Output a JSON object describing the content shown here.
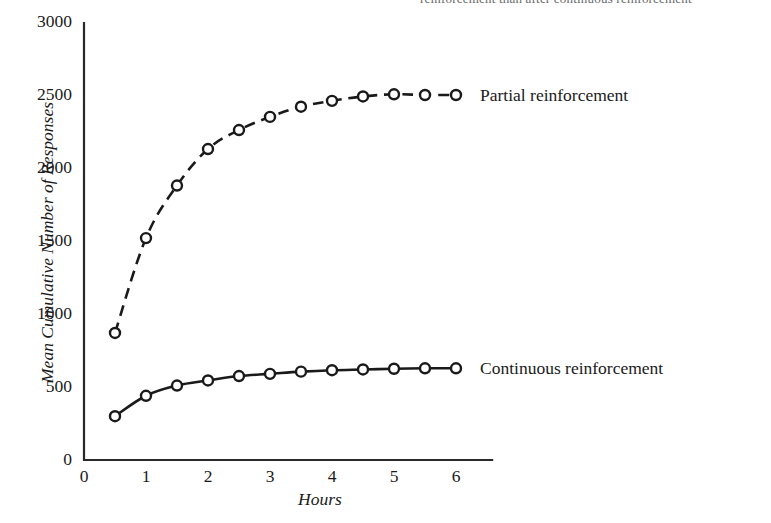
{
  "figure": {
    "caption_sliver": "reinforcement than after continuous reinforcement"
  },
  "chart_data": {
    "type": "line",
    "title": "",
    "xlabel": "Hours",
    "ylabel": "Mean Cumulative Number of Responses",
    "xlim": [
      0,
      6.6
    ],
    "ylim": [
      0,
      3000
    ],
    "grid": false,
    "legend_position": "inline-right",
    "xticks": [
      "0",
      "1",
      "2",
      "3",
      "4",
      "5",
      "6"
    ],
    "xtick_values": [
      0,
      1,
      2,
      3,
      4,
      5,
      6
    ],
    "yticks": [
      "0",
      "500",
      "1000",
      "1500",
      "2000",
      "2500",
      "3000"
    ],
    "ytick_values": [
      0,
      500,
      1000,
      1500,
      2000,
      2500,
      3000
    ],
    "x": [
      0.5,
      1.0,
      1.5,
      2.0,
      2.5,
      3.0,
      3.5,
      4.0,
      4.5,
      5.0,
      5.5,
      6.0
    ],
    "series": [
      {
        "name": "Partial reinforcement",
        "style": "dashed",
        "marker": "open-circle",
        "color": "#1a1a1a",
        "values": [
          870,
          1520,
          1880,
          2130,
          2260,
          2350,
          2420,
          2460,
          2490,
          2505,
          2500,
          2500
        ]
      },
      {
        "name": "Continuous reinforcement",
        "style": "solid",
        "marker": "open-circle",
        "color": "#1a1a1a",
        "values": [
          300,
          440,
          510,
          545,
          575,
          590,
          605,
          615,
          620,
          625,
          628,
          628
        ]
      }
    ]
  },
  "annotations": {
    "partial_label": "Partial reinforcement",
    "continuous_label": "Continuous reinforcement"
  }
}
